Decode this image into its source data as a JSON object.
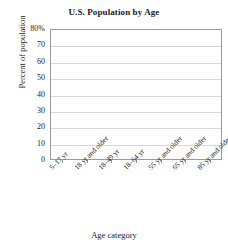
{
  "chart_data": {
    "type": "bar",
    "title": "U.S. Population by Age",
    "xlabel": "Age category",
    "ylabel": "Percent of population",
    "categories": [
      "5–17 yr",
      "18 yr and older",
      "18–49 yr",
      "18–64 yr",
      "55 yr and older",
      "65 yr and older",
      "85 yr and older"
    ],
    "values": [
      null,
      null,
      null,
      null,
      null,
      null,
      null
    ],
    "ylim": [
      0,
      80
    ],
    "yticks": [
      0,
      10,
      20,
      30,
      40,
      50,
      60,
      70,
      80
    ],
    "ytick_labels": [
      "0",
      "10",
      "20",
      "30",
      "40",
      "50",
      "60",
      "70",
      "80%"
    ],
    "grid": true,
    "legend": false,
    "note": "empty plot area — axes and gridlines only, no bars drawn"
  },
  "colors": {
    "axis": "#9a9a9a",
    "gridline": "#d8d8d8",
    "text": "#1a1a1a",
    "background": "#ffffff"
  }
}
